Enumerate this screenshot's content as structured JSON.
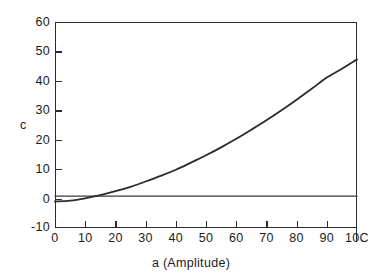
{
  "chart_data": {
    "type": "line",
    "title": "",
    "subtitle": "",
    "xlabel": "a (Amplitude)",
    "ylabel": "c",
    "xlim": [
      0,
      100
    ],
    "ylim": [
      -10,
      60
    ],
    "grid": false,
    "legend": null,
    "x_ticks": [
      0,
      10,
      20,
      30,
      40,
      50,
      60,
      70,
      80,
      90,
      100
    ],
    "x_tick_labels": [
      "0",
      "10",
      "20",
      "30",
      "40",
      "50",
      "60",
      "70",
      "80",
      "90",
      "10C"
    ],
    "y_ticks": [
      -10,
      0,
      10,
      20,
      30,
      40,
      50,
      60
    ],
    "y_tick_labels": [
      "-10",
      "0",
      "10",
      "20",
      "30",
      "40",
      "50",
      "60"
    ],
    "series": [
      {
        "name": "c curve",
        "color": "#2b2b2b",
        "x": [
          0,
          5,
          10,
          15,
          20,
          25,
          30,
          35,
          40,
          45,
          50,
          55,
          60,
          65,
          70,
          75,
          80,
          85,
          90,
          95,
          100
        ],
        "values": [
          -1.0,
          -0.7,
          0.1,
          1.2,
          2.5,
          4.0,
          5.8,
          7.7,
          9.8,
          12.2,
          14.7,
          17.4,
          20.3,
          23.4,
          26.6,
          30.0,
          33.6,
          37.3,
          41.1,
          44.1,
          47.3
        ]
      },
      {
        "name": "baseline",
        "color": "#3a3a3a",
        "x": [
          0,
          100
        ],
        "values": [
          0.8,
          0.8
        ]
      }
    ]
  },
  "axes": {
    "y_title": "c",
    "x_title": "a (Amplitude)"
  }
}
